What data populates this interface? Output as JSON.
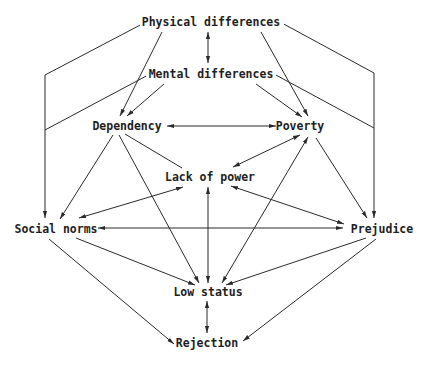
{
  "diagram": {
    "type": "causal-network",
    "nodes": {
      "physical": {
        "label": "Physical differences",
        "x": 211,
        "y": 22
      },
      "mental": {
        "label": "Mental differences",
        "x": 211,
        "y": 74
      },
      "dependency": {
        "label": "Dependency",
        "x": 127,
        "y": 126
      },
      "poverty": {
        "label": "Poverty",
        "x": 296,
        "y": 126
      },
      "lack_of_power": {
        "label": "Lack of power",
        "x": 210,
        "y": 176
      },
      "social_norms": {
        "label": "Social norms",
        "x": 56,
        "y": 229
      },
      "prejudice": {
        "label": "Prejudice",
        "x": 364,
        "y": 229
      },
      "low_status": {
        "label": "Low status",
        "x": 210,
        "y": 292
      },
      "rejection": {
        "label": "Rejection",
        "x": 208,
        "y": 343
      }
    },
    "edges": [
      {
        "from": "physical",
        "to": "mental",
        "direction": "both"
      },
      {
        "from": "physical",
        "to": "dependency",
        "direction": "forward"
      },
      {
        "from": "physical",
        "to": "poverty",
        "direction": "forward"
      },
      {
        "from": "physical",
        "to": "social_norms",
        "direction": "forward",
        "routing": "left-bracket"
      },
      {
        "from": "physical",
        "to": "prejudice",
        "direction": "forward",
        "routing": "right-bracket"
      },
      {
        "from": "mental",
        "to": "dependency",
        "direction": "forward"
      },
      {
        "from": "mental",
        "to": "poverty",
        "direction": "forward"
      },
      {
        "from": "mental",
        "to": "social_norms",
        "direction": "forward",
        "routing": "left-bracket"
      },
      {
        "from": "mental",
        "to": "prejudice",
        "direction": "forward",
        "routing": "right-bracket"
      },
      {
        "from": "dependency",
        "to": "poverty",
        "direction": "both"
      },
      {
        "from": "dependency",
        "to": "lack_of_power",
        "direction": "none"
      },
      {
        "from": "dependency",
        "to": "social_norms",
        "direction": "forward"
      },
      {
        "from": "dependency",
        "to": "low_status",
        "direction": "forward"
      },
      {
        "from": "poverty",
        "to": "lack_of_power",
        "direction": "both"
      },
      {
        "from": "poverty",
        "to": "prejudice",
        "direction": "forward"
      },
      {
        "from": "poverty",
        "to": "low_status",
        "direction": "both"
      },
      {
        "from": "lack_of_power",
        "to": "social_norms",
        "direction": "both"
      },
      {
        "from": "lack_of_power",
        "to": "prejudice",
        "direction": "both"
      },
      {
        "from": "lack_of_power",
        "to": "low_status",
        "direction": "both"
      },
      {
        "from": "prejudice",
        "to": "social_norms",
        "direction": "both"
      },
      {
        "from": "social_norms",
        "to": "low_status",
        "direction": "forward"
      },
      {
        "from": "social_norms",
        "to": "rejection",
        "direction": "forward"
      },
      {
        "from": "prejudice",
        "to": "low_status",
        "direction": "forward"
      },
      {
        "from": "prejudice",
        "to": "rejection",
        "direction": "forward"
      },
      {
        "from": "low_status",
        "to": "rejection",
        "direction": "both"
      }
    ]
  }
}
